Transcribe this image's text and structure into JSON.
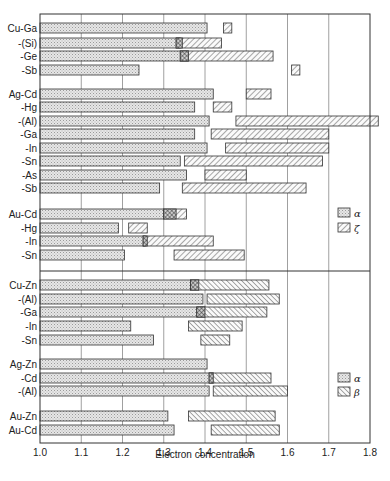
{
  "chart_data": {
    "type": "bar",
    "subtype": "horizontal-range (phase stability ranges)",
    "title": "",
    "xlabel": "Electron concentration",
    "ylabel": "",
    "xlim": [
      1.0,
      1.8
    ],
    "x_ticks": [
      "1.0",
      "1.1",
      "1.2",
      "1.3",
      "1.4",
      "1.5",
      "1.6",
      "1.7",
      "1.8"
    ],
    "grid": "vertical gridlines at every 0.1",
    "colors": {
      "alpha_fill": "#e4e4e4",
      "hatch_fill": "#ffffff",
      "stroke": "#333333",
      "grid": "#888888"
    },
    "panels": [
      {
        "name": "upper",
        "legend": [
          {
            "symbol": "alpha",
            "label": "α",
            "style": "dotted"
          },
          {
            "symbol": "zeta",
            "label": "ζ",
            "style": "hatch-forward"
          }
        ],
        "groups": [
          {
            "rows": [
              {
                "label": "Cu-Ga",
                "y": 28,
                "alpha": [
                  1.0,
                  1.405
                ],
                "zeta": [
                  [
                    1.445,
                    1.465
                  ]
                ]
              },
              {
                "label": "-(Si)",
                "y": 43,
                "alpha": [
                  1.0,
                  1.34
                ],
                "zeta": [
                  [
                    1.33,
                    1.44
                  ]
                ],
                "two_phase": [
                  1.33,
                  1.345
                ]
              },
              {
                "label": "-Ge",
                "y": 56,
                "alpha": [
                  1.0,
                  1.36
                ],
                "zeta": [
                  [
                    1.34,
                    1.565
                  ]
                ],
                "two_phase": [
                  1.34,
                  1.36
                ]
              },
              {
                "label": "-Sb",
                "y": 70,
                "alpha": [
                  1.0,
                  1.24
                ],
                "zeta": [
                  [
                    1.61,
                    1.63
                  ]
                ]
              }
            ]
          },
          {
            "rows": [
              {
                "label": "Ag-Cd",
                "y": 94,
                "alpha": [
                  1.0,
                  1.42
                ],
                "zeta": [
                  [
                    1.5,
                    1.56
                  ]
                ]
              },
              {
                "label": "-Hg",
                "y": 107,
                "alpha": [
                  1.0,
                  1.375
                ],
                "zeta": [
                  [
                    1.42,
                    1.465
                  ]
                ]
              },
              {
                "label": "-(Al)",
                "y": 121,
                "alpha": [
                  1.0,
                  1.41
                ],
                "zeta": [
                  [
                    1.475,
                    1.82
                  ]
                ]
              },
              {
                "label": "-Ga",
                "y": 134,
                "alpha": [
                  1.0,
                  1.375
                ],
                "zeta": [
                  [
                    1.415,
                    1.7
                  ]
                ]
              },
              {
                "label": "-In",
                "y": 148,
                "alpha": [
                  1.0,
                  1.405
                ],
                "zeta": [
                  [
                    1.45,
                    1.7
                  ]
                ]
              },
              {
                "label": "-Sn",
                "y": 161,
                "alpha": [
                  1.0,
                  1.34
                ],
                "zeta": [
                  [
                    1.35,
                    1.685
                  ]
                ]
              },
              {
                "label": "-As",
                "y": 175,
                "alpha": [
                  1.0,
                  1.355
                ],
                "zeta": [
                  [
                    1.4,
                    1.5
                  ]
                ]
              },
              {
                "label": "-Sb",
                "y": 188,
                "alpha": [
                  1.0,
                  1.29
                ],
                "zeta": [
                  [
                    1.345,
                    1.645
                  ]
                ]
              }
            ]
          },
          {
            "rows": [
              {
                "label": "Au-Cd",
                "y": 214,
                "alpha": [
                  1.0,
                  1.3
                ],
                "zeta": [
                  [
                    1.3,
                    1.355
                  ]
                ],
                "two_phase": [
                  1.3,
                  1.33
                ]
              },
              {
                "label": "-Hg",
                "y": 228,
                "alpha": [
                  1.0,
                  1.19
                ],
                "zeta": [
                  [
                    1.215,
                    1.26
                  ]
                ]
              },
              {
                "label": "-In",
                "y": 241,
                "alpha": [
                  1.0,
                  1.255
                ],
                "zeta": [
                  [
                    1.25,
                    1.42
                  ]
                ],
                "two_phase": [
                  1.25,
                  1.26
                ]
              },
              {
                "label": "-Sn",
                "y": 255,
                "alpha": [
                  1.0,
                  1.205
                ],
                "zeta": [
                  [
                    1.325,
                    1.495
                  ]
                ]
              }
            ]
          }
        ]
      },
      {
        "name": "lower",
        "legend": [
          {
            "symbol": "alpha",
            "label": "α",
            "style": "dotted"
          },
          {
            "symbol": "beta",
            "label": "β",
            "style": "hatch-back"
          }
        ],
        "groups": [
          {
            "rows": [
              {
                "label": "Cu-Zn",
                "y": 285,
                "alpha": [
                  1.0,
                  1.385
                ],
                "beta": [
                  [
                    1.365,
                    1.555
                  ]
                ],
                "two_phase": [
                  1.365,
                  1.385
                ]
              },
              {
                "label": "-(Al)",
                "y": 299,
                "alpha": [
                  1.0,
                  1.395
                ],
                "beta": [
                  [
                    1.405,
                    1.58
                  ]
                ]
              },
              {
                "label": "-Ga",
                "y": 312,
                "alpha": [
                  1.0,
                  1.4
                ],
                "beta": [
                  [
                    1.38,
                    1.55
                  ]
                ],
                "two_phase": [
                  1.38,
                  1.4
                ]
              },
              {
                "label": "-In",
                "y": 326,
                "alpha": [
                  1.0,
                  1.22
                ],
                "beta": [
                  [
                    1.36,
                    1.49
                  ]
                ]
              },
              {
                "label": "-Sn",
                "y": 340,
                "alpha": [
                  1.0,
                  1.275
                ],
                "beta": [
                  [
                    1.39,
                    1.46
                  ]
                ]
              }
            ]
          },
          {
            "rows": [
              {
                "label": "Ag-Zn",
                "y": 364,
                "alpha": [
                  1.0,
                  1.405
                ],
                "beta": []
              },
              {
                "label": "-Cd",
                "y": 378,
                "alpha": [
                  1.0,
                  1.42
                ],
                "beta": [
                  [
                    1.41,
                    1.56
                  ]
                ],
                "two_phase": [
                  1.41,
                  1.42
                ]
              },
              {
                "label": "-(Al)",
                "y": 391,
                "alpha": [
                  1.0,
                  1.41
                ],
                "beta": [
                  [
                    1.42,
                    1.6
                  ]
                ]
              }
            ]
          },
          {
            "rows": [
              {
                "label": "Au-Zn",
                "y": 416,
                "alpha": [
                  1.0,
                  1.31
                ],
                "beta": [
                  [
                    1.36,
                    1.57
                  ]
                ]
              },
              {
                "label": "Au-Cd",
                "y": 430,
                "alpha": [
                  1.0,
                  1.325
                ],
                "beta": [
                  [
                    1.415,
                    1.58
                  ]
                ]
              }
            ]
          }
        ]
      }
    ]
  },
  "layout": {
    "plot_left": 40,
    "plot_right": 370,
    "plot_top": 14,
    "plot_bottom": 443,
    "panel_divider_y": 271,
    "bar_height": 10,
    "legend_upper": {
      "x": 338,
      "y1": 213,
      "y2": 228
    },
    "legend_lower": {
      "x": 338,
      "y1": 378,
      "y2": 392
    }
  }
}
